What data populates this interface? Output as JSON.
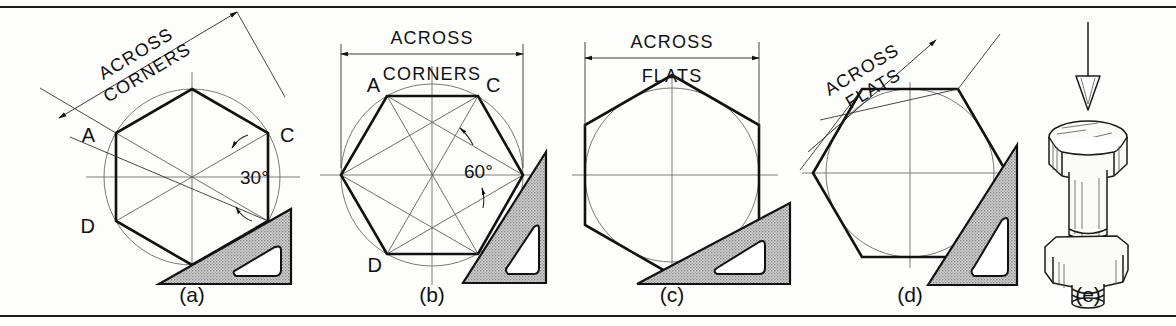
{
  "figure": {
    "background_color": "#fdfdfc",
    "line_color": "#111111",
    "shade_color": "#b9b9b9"
  },
  "panels": [
    {
      "id": "a",
      "caption": "(a)",
      "dimension_label_line1": "ACROSS",
      "dimension_label_line2": "CORNERS",
      "dimension_rotated": true,
      "dimension_rotation_deg": -31,
      "angle_label": "30°",
      "vertex_labels": [
        "A",
        "C",
        "D",
        "B"
      ],
      "hexagon_orientation": "pointy-top",
      "circle_type": "circumscribed",
      "has_set_square": true
    },
    {
      "id": "b",
      "caption": "(b)",
      "dimension_label_line1": "ACROSS",
      "dimension_label_line2": "CORNERS",
      "dimension_rotated": false,
      "dimension_rotation_deg": 0,
      "angle_label": "60°",
      "vertex_labels": [
        "A",
        "C",
        "D",
        "B"
      ],
      "hexagon_orientation": "flat-top",
      "circle_type": "circumscribed",
      "has_set_square": true
    },
    {
      "id": "c",
      "caption": "(c)",
      "dimension_label_line1": "ACROSS",
      "dimension_label_line2": "FLATS",
      "dimension_rotated": false,
      "dimension_rotation_deg": 0,
      "angle_label": "",
      "vertex_labels": [],
      "hexagon_orientation": "pointy-top",
      "circle_type": "inscribed",
      "has_set_square": true
    },
    {
      "id": "d",
      "caption": "(d)",
      "dimension_label_line1": "ACROSS",
      "dimension_label_line2": "FLATS",
      "dimension_rotated": true,
      "dimension_rotation_deg": -31,
      "angle_label": "",
      "vertex_labels": [],
      "hexagon_orientation": "flat-top",
      "circle_type": "inscribed",
      "has_set_square": true
    },
    {
      "id": "e",
      "caption": "(e)",
      "dimension_label_line1": "",
      "dimension_label_line2": "",
      "dimension_rotated": false,
      "dimension_rotation_deg": 0,
      "angle_label": "",
      "vertex_labels": [],
      "hexagon_orientation": "pictorial",
      "circle_type": "none",
      "has_set_square": false,
      "subject": "hex-head bolt with nut, arrow pointing down"
    }
  ],
  "captions": {
    "a": "(a)",
    "b": "(b)",
    "c": "(c)",
    "d": "(d)",
    "e": "(e)"
  },
  "labels": {
    "across": "ACROSS",
    "corners": "CORNERS",
    "flats": "FLATS",
    "deg30": "30°",
    "deg60": "60°",
    "A": "A",
    "B": "B",
    "C": "C",
    "D": "D"
  }
}
